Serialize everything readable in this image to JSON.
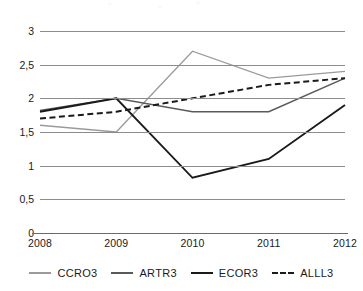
{
  "chart_data": {
    "type": "line",
    "title": "",
    "subtitle": "",
    "xlabel": "",
    "ylabel": "",
    "x": [
      "2008",
      "2009",
      "2010",
      "2011",
      "2012"
    ],
    "categories": [
      "2008",
      "2009",
      "2010",
      "2011",
      "2012"
    ],
    "ylim": [
      0,
      3
    ],
    "yticks": [
      "0",
      "0,5",
      "1",
      "1,5",
      "2",
      "2,5",
      "3"
    ],
    "ytick_values": [
      0,
      0.5,
      1,
      1.5,
      2,
      2.5,
      3
    ],
    "grid": "horizontal",
    "legend_position": "bottom",
    "decimal_separator": ",",
    "series": [
      {
        "name": "CCRO3",
        "values": [
          1.6,
          1.5,
          2.7,
          2.3,
          2.4
        ],
        "color": "#9a9a9a",
        "style": "solid",
        "width": 1.3
      },
      {
        "name": "ARTR3",
        "values": [
          1.82,
          2.0,
          1.8,
          1.8,
          2.3
        ],
        "color": "#5a5a5a",
        "style": "solid",
        "width": 1.6
      },
      {
        "name": "ECOR3",
        "values": [
          1.8,
          2.0,
          0.82,
          1.1,
          1.9
        ],
        "color": "#1a1a1a",
        "style": "solid",
        "width": 1.9
      },
      {
        "name": "ALLL3",
        "values": [
          1.7,
          1.8,
          2.0,
          2.2,
          2.3
        ],
        "color": "#1a1a1a",
        "style": "dashed",
        "width": 2.0
      }
    ]
  },
  "legend": {
    "items": [
      {
        "label": "CCRO3"
      },
      {
        "label": "ARTR3"
      },
      {
        "label": "ECOR3"
      },
      {
        "label": "ALLL3"
      }
    ]
  }
}
